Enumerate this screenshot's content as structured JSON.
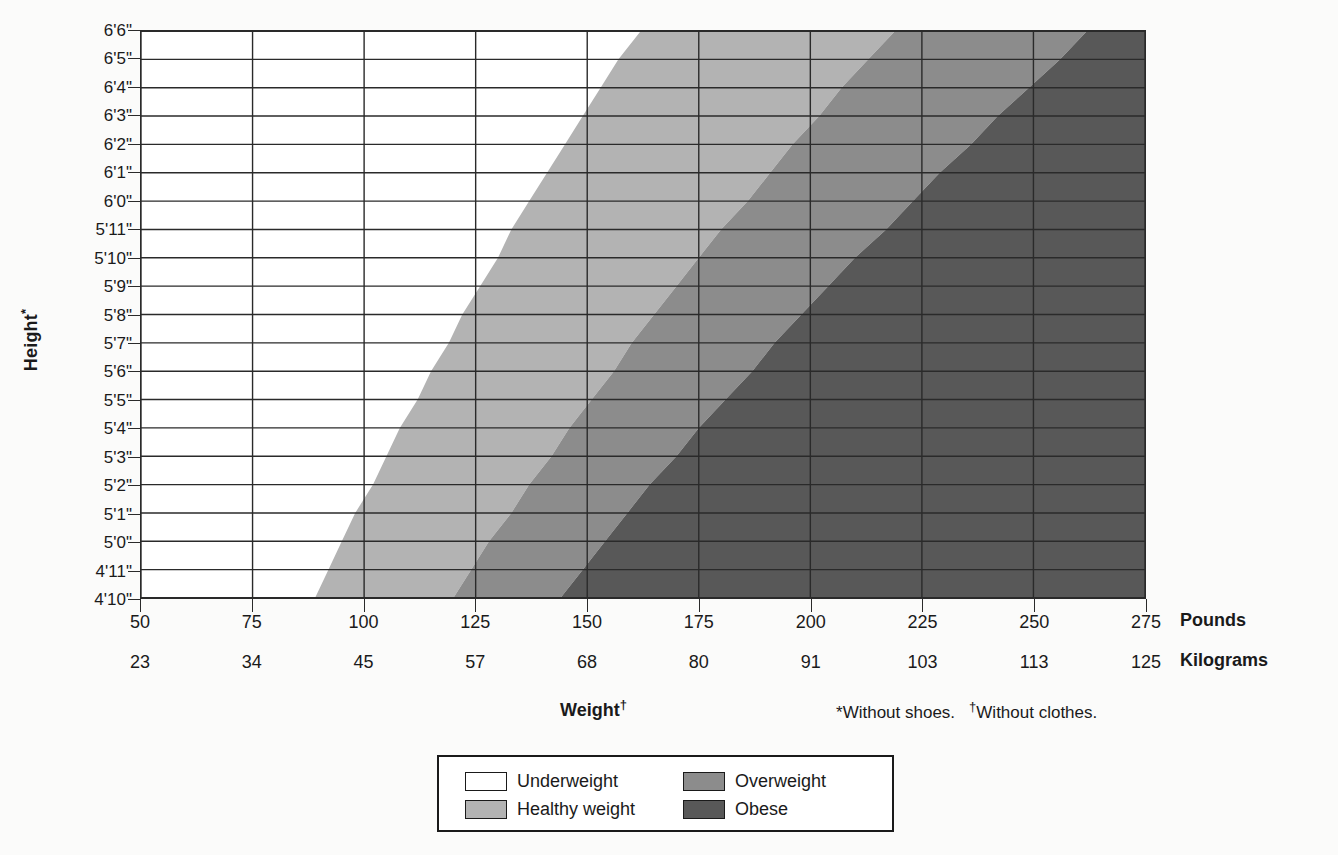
{
  "axes": {
    "y_title": "Height",
    "y_title_marker": "*",
    "x_title": "Weight",
    "x_title_marker": "†",
    "height_labels": [
      "6'6\"",
      "6'5\"",
      "6'4\"",
      "6'3\"",
      "6'2\"",
      "6'1\"",
      "6'0\"",
      "5'11\"",
      "5'10\"",
      "5'9\"",
      "5'8\"",
      "5'7\"",
      "5'6\"",
      "5'5\"",
      "5'4\"",
      "5'3\"",
      "5'2\"",
      "5'1\"",
      "5'0\"",
      "4'11\"",
      "4'10\""
    ],
    "pounds_label": "Pounds",
    "kilograms_label": "Kilograms",
    "pounds_ticks": [
      "50",
      "75",
      "100",
      "125",
      "150",
      "175",
      "200",
      "225",
      "250",
      "275"
    ],
    "kilogram_ticks": [
      "23",
      "34",
      "45",
      "57",
      "68",
      "80",
      "91",
      "103",
      "113",
      "125"
    ]
  },
  "footnotes": {
    "shoes_marker": "*",
    "shoes_text": "Without shoes.",
    "clothes_marker": "†",
    "clothes_text": "Without clothes."
  },
  "legend": {
    "items": [
      {
        "label": "Underweight",
        "color": "#ffffff",
        "key": "underweight"
      },
      {
        "label": "Overweight",
        "color": "#8c8c8c",
        "key": "overweight"
      },
      {
        "label": "Healthy weight",
        "color": "#b3b3b3",
        "key": "healthy"
      },
      {
        "label": "Obese",
        "color": "#585858",
        "key": "obese"
      }
    ]
  },
  "colors": {
    "underweight": "#ffffff",
    "healthy": "#b3b3b3",
    "overweight": "#8c8c8c",
    "obese": "#585858",
    "grid": "#2a2a2a",
    "background": "#fbfbfa",
    "text": "#1a1a1a"
  },
  "chart_data": {
    "type": "area",
    "xlabel": "Weight",
    "ylabel": "Height",
    "xlim_pounds": [
      50,
      275
    ],
    "xlim_kilograms": [
      23,
      125
    ],
    "grid": true,
    "legend_position": "bottom-center",
    "x_ticks_pounds": [
      50,
      75,
      100,
      125,
      150,
      175,
      200,
      225,
      250,
      275
    ],
    "x_ticks_kilograms": [
      23,
      34,
      45,
      57,
      68,
      80,
      91,
      103,
      113,
      125
    ],
    "y_categories": [
      "6'6\"",
      "6'5\"",
      "6'4\"",
      "6'3\"",
      "6'2\"",
      "6'1\"",
      "6'0\"",
      "5'11\"",
      "5'10\"",
      "5'9\"",
      "5'8\"",
      "5'7\"",
      "5'6\"",
      "5'5\"",
      "5'4\"",
      "5'3\"",
      "5'2\"",
      "5'1\"",
      "5'0\"",
      "4'11\"",
      "4'10\""
    ],
    "band_boundaries_note": "Boundary weight in pounds at each height, from bottom (4'10\") to top (6'6\")",
    "series": [
      {
        "name": "underweight-to-healthy",
        "bmi": 18.5,
        "values": [
          89,
          92,
          95,
          98,
          102,
          105,
          108,
          112,
          115,
          119,
          122,
          126,
          130,
          133,
          137,
          141,
          145,
          149,
          153,
          157,
          162
        ]
      },
      {
        "name": "healthy-to-overweight",
        "bmi": 25,
        "values": [
          120,
          124,
          128,
          133,
          137,
          142,
          146,
          151,
          156,
          160,
          165,
          170,
          175,
          180,
          186,
          191,
          196,
          202,
          207,
          213,
          219
        ]
      },
      {
        "name": "overweight-to-obese",
        "bmi": 30,
        "values": [
          144,
          149,
          154,
          159,
          164,
          170,
          175,
          181,
          187,
          192,
          198,
          204,
          210,
          217,
          223,
          229,
          236,
          242,
          249,
          256,
          262
        ]
      }
    ],
    "regions": [
      {
        "name": "Underweight",
        "bmi_range": "< 18.5",
        "color": "#ffffff"
      },
      {
        "name": "Healthy weight",
        "bmi_range": "18.5 - 24.9",
        "color": "#b3b3b3"
      },
      {
        "name": "Overweight",
        "bmi_range": "25 - 29.9",
        "color": "#8c8c8c"
      },
      {
        "name": "Obese",
        "bmi_range": "30+",
        "color": "#585858"
      }
    ]
  }
}
